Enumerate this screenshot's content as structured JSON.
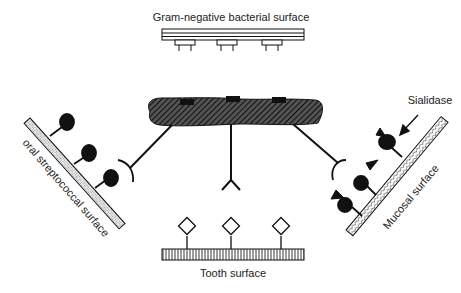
{
  "labels": {
    "gram_negative": "Gram-negative bacterial surface",
    "oral_strep": "oral streptococcal surface",
    "mucosal": "Mucosal surface",
    "sialidase": "Sialidase",
    "tooth": "Tooth surface"
  },
  "colors": {
    "ink": "#111111",
    "strep_fill": "#e6e6e6",
    "background": "#ffffff"
  }
}
